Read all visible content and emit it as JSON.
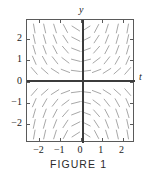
{
  "figure": {
    "caption": "FIGURE 1",
    "axis_names": {
      "horizontal": "t",
      "vertical": "y"
    },
    "colors": {
      "background": "#ffffff",
      "frame": "#5a5a5a",
      "axis": "#3c3c3c",
      "slope_mark": "#a8a8a8",
      "text": "#1a1a1a"
    }
  },
  "chart_data": {
    "type": "scatter",
    "subtype": "direction-field",
    "title": "FIGURE 1",
    "xlabel": "t",
    "ylabel": "y",
    "xlim": [
      -2.6,
      2.6
    ],
    "ylim": [
      -2.9,
      2.9
    ],
    "grid": false,
    "legend": null,
    "xticks": [
      -2,
      -1,
      0,
      1,
      2
    ],
    "xtick_labels": [
      "−2",
      "−1",
      "0",
      "1",
      "2"
    ],
    "yticks": [
      -2,
      -1,
      0,
      1,
      2
    ],
    "ytick_labels": [
      "−2",
      "−1",
      "0",
      "1",
      "2"
    ],
    "slope_function": "dy/dt = t*y",
    "mark_length": 9,
    "sample_t": [
      -2.25,
      -1.75,
      -1.25,
      -0.75,
      -0.25,
      0.25,
      0.75,
      1.25,
      1.75,
      2.25
    ],
    "sample_y": [
      -2.5,
      -2.0,
      -1.5,
      -1.0,
      -0.5,
      0.5,
      1.0,
      1.5,
      2.0,
      2.5
    ],
    "annotations": [
      {
        "text": "t",
        "position": "right of horizontal axis"
      },
      {
        "text": "y",
        "position": "above vertical axis"
      }
    ]
  }
}
